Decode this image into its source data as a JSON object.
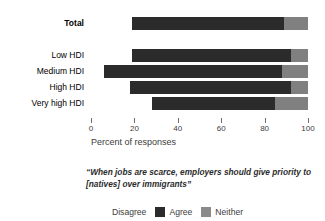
{
  "chart_data": {
    "type": "bar",
    "orientation": "horizontal",
    "stacked": true,
    "title": "",
    "subtitle": "",
    "xlabel": "Percent of responses",
    "ylabel": "",
    "xlim": [
      0,
      100
    ],
    "xticks": [
      0,
      20,
      40,
      60,
      80,
      100
    ],
    "xtick_labels": [
      "0",
      "20",
      "40",
      "60",
      "80",
      "100"
    ],
    "grid": false,
    "legend_position": "bottom",
    "categories": [
      "Total",
      "Low HDI",
      "Medium HDI",
      "High HDI",
      "Very high HDI"
    ],
    "series": [
      {
        "name": "Disagree",
        "color": "#ffffff",
        "values": [
          19,
          19,
          6,
          18,
          28
        ]
      },
      {
        "name": "Agree",
        "color": "#2b2b2b",
        "values": [
          70,
          73,
          82,
          74,
          57
        ]
      },
      {
        "name": "Neither",
        "color": "#808080",
        "values": [
          11,
          8,
          12,
          8,
          15
        ]
      }
    ],
    "annotation": "“When jobs are scarce, employers should give priority to [natives] over immigrants”"
  },
  "axis": {
    "xlabel": "Percent of responses",
    "ticks": [
      {
        "value": 0,
        "label": "0"
      },
      {
        "value": 20,
        "label": "20"
      },
      {
        "value": 40,
        "label": "40"
      },
      {
        "value": 60,
        "label": "60"
      },
      {
        "value": 80,
        "label": "80"
      },
      {
        "value": 100,
        "label": "100"
      }
    ]
  },
  "rows": [
    {
      "label": "Total",
      "bold": true,
      "disagree": 19,
      "agree": 70,
      "neither": 11
    },
    {
      "label": "Low HDI",
      "bold": false,
      "disagree": 19,
      "agree": 73,
      "neither": 8
    },
    {
      "label": "Medium HDI",
      "bold": false,
      "disagree": 6,
      "agree": 82,
      "neither": 12
    },
    {
      "label": "High HDI",
      "bold": false,
      "disagree": 18,
      "agree": 74,
      "neither": 8
    },
    {
      "label": "Very high HDI",
      "bold": false,
      "disagree": 28,
      "agree": 57,
      "neither": 15
    }
  ],
  "caption": {
    "line1": "“When jobs are scarce, employers should give priority",
    "line2": "to [natives] over immigrants”"
  },
  "legend": {
    "items": [
      {
        "label": "Disagree",
        "key": "disagree",
        "color": "#ffffff"
      },
      {
        "label": "Agree",
        "key": "agree",
        "color": "#2b2b2b"
      },
      {
        "label": "Neither",
        "key": "neither",
        "color": "#8a8a8a"
      }
    ]
  },
  "colors": {
    "agree": "#2b2b2b",
    "neither": "#808080",
    "disagree": "#ffffff",
    "text": "#3c3c3c",
    "background": "#ffffff"
  }
}
